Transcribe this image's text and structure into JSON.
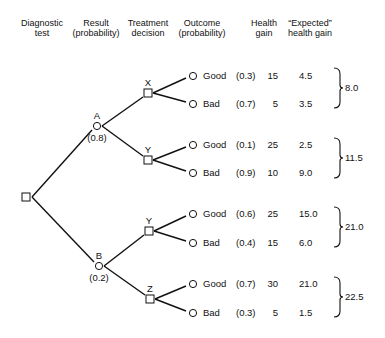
{
  "headers": [
    {
      "line1": "Diagnostic",
      "line2": "test",
      "x": 42
    },
    {
      "line1": "Result",
      "line2": "(probability)",
      "x": 96
    },
    {
      "line1": "Treatment",
      "line2": "decision",
      "x": 148
    },
    {
      "line1": "Outcome",
      "line2": "(probability)",
      "x": 202
    },
    {
      "line1": "Health",
      "line2": "gain",
      "x": 264
    },
    {
      "line1": "“Expected”",
      "line2": "health gain",
      "x": 310
    }
  ],
  "root": {
    "type": "decision",
    "x": 27,
    "y": 197
  },
  "results": [
    {
      "label": "A",
      "probability": "(0.8)",
      "x": 97,
      "y": 126
    },
    {
      "label": "B",
      "probability": "(0.2)",
      "x": 99,
      "y": 266
    }
  ],
  "treatments": [
    {
      "label": "X",
      "result": "A",
      "x": 148,
      "y": 93
    },
    {
      "label": "Y",
      "result": "A",
      "x": 148,
      "y": 160
    },
    {
      "label": "Y",
      "result": "B",
      "x": 149,
      "y": 231
    },
    {
      "label": "Z",
      "result": "B",
      "x": 150,
      "y": 299
    }
  ],
  "outcomes": [
    {
      "treatment": 0,
      "outcome": "Good",
      "probability": "(0.3)",
      "health_gain": "15",
      "expected": "4.5",
      "y": 76
    },
    {
      "treatment": 0,
      "outcome": "Bad",
      "probability": "(0.7)",
      "health_gain": "5",
      "expected": "3.5",
      "y": 104
    },
    {
      "treatment": 1,
      "outcome": "Good",
      "probability": "(0.1)",
      "health_gain": "25",
      "expected": "2.5",
      "y": 145
    },
    {
      "treatment": 1,
      "outcome": "Bad",
      "probability": "(0.9)",
      "health_gain": "10",
      "expected": "9.0",
      "y": 173
    },
    {
      "treatment": 2,
      "outcome": "Good",
      "probability": "(0.6)",
      "health_gain": "25",
      "expected": "15.0",
      "y": 214
    },
    {
      "treatment": 2,
      "outcome": "Bad",
      "probability": "(0.4)",
      "health_gain": "15",
      "expected": "6.0",
      "y": 243
    },
    {
      "treatment": 3,
      "outcome": "Good",
      "probability": "(0.7)",
      "health_gain": "30",
      "expected": "21.0",
      "y": 284
    },
    {
      "treatment": 3,
      "outcome": "Bad",
      "probability": "(0.3)",
      "health_gain": "5",
      "expected": "1.5",
      "y": 313
    }
  ],
  "totals": [
    {
      "value": "8.0",
      "top": 68,
      "bottom": 108
    },
    {
      "value": "11.5",
      "top": 138,
      "bottom": 178
    },
    {
      "value": "21.0",
      "top": 207,
      "bottom": 247
    },
    {
      "value": "22.5",
      "top": 277,
      "bottom": 317
    }
  ]
}
